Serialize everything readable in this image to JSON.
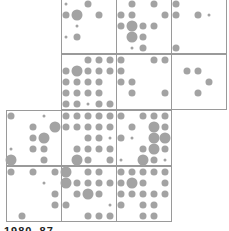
{
  "chart_data": {
    "type": "heatmap",
    "title": "",
    "layout": {
      "cell_size_px": 55,
      "col_x": [
        6,
        61,
        116,
        171
      ],
      "row_y": [
        -2,
        54,
        110,
        166
      ],
      "dot_pitch_px": 11
    },
    "size_scale": {
      "1": 3,
      "2": 7,
      "3": 11
    },
    "cells": [
      {
        "row": 0,
        "col": 1,
        "dots": [
          [
            1,
            0,
            2,
            0,
            0
          ],
          [
            2,
            3,
            0,
            2,
            0
          ],
          [
            0,
            1,
            0,
            0,
            0
          ],
          [
            1,
            2,
            0,
            0,
            0
          ],
          [
            0,
            0,
            0,
            0,
            0
          ]
        ]
      },
      {
        "row": 0,
        "col": 2,
        "dots": [
          [
            0,
            2,
            0,
            2,
            0
          ],
          [
            2,
            2,
            0,
            0,
            2
          ],
          [
            2,
            3,
            2,
            2,
            0
          ],
          [
            0,
            3,
            2,
            0,
            0
          ],
          [
            0,
            1,
            2,
            0,
            0
          ]
        ]
      },
      {
        "row": 0,
        "col": 3,
        "dots": [
          [
            2,
            0,
            0,
            0,
            0
          ],
          [
            2,
            0,
            2,
            1,
            0
          ],
          [
            0,
            0,
            0,
            0,
            0
          ],
          [
            0,
            0,
            0,
            0,
            0
          ],
          [
            2,
            0,
            0,
            0,
            0
          ]
        ]
      },
      {
        "row": 1,
        "col": 1,
        "dots": [
          [
            0,
            0,
            2,
            2,
            2
          ],
          [
            2,
            3,
            2,
            2,
            2
          ],
          [
            2,
            2,
            2,
            2,
            0
          ],
          [
            2,
            2,
            2,
            2,
            0
          ],
          [
            2,
            2,
            1,
            2,
            2
          ]
        ]
      },
      {
        "row": 1,
        "col": 2,
        "dots": [
          [
            2,
            0,
            0,
            2,
            2
          ],
          [
            2,
            0,
            0,
            0,
            0
          ],
          [
            2,
            2,
            0,
            0,
            0
          ],
          [
            0,
            2,
            0,
            0,
            2
          ],
          [
            0,
            0,
            0,
            0,
            0
          ]
        ]
      },
      {
        "row": 1,
        "col": 3,
        "dots": [
          [
            0,
            0,
            0,
            0,
            0
          ],
          [
            0,
            2,
            2,
            0,
            0
          ],
          [
            0,
            0,
            0,
            2,
            0
          ],
          [
            0,
            0,
            2,
            0,
            0
          ],
          [
            0,
            0,
            0,
            0,
            0
          ]
        ]
      },
      {
        "row": 2,
        "col": 0,
        "dots": [
          [
            2,
            0,
            0,
            1,
            0
          ],
          [
            0,
            0,
            2,
            0,
            3
          ],
          [
            0,
            0,
            2,
            3,
            0
          ],
          [
            1,
            0,
            2,
            2,
            0
          ],
          [
            3,
            0,
            0,
            2,
            0
          ]
        ]
      },
      {
        "row": 2,
        "col": 1,
        "dots": [
          [
            2,
            2,
            2,
            2,
            2
          ],
          [
            2,
            2,
            2,
            2,
            2
          ],
          [
            0,
            0,
            2,
            2,
            1
          ],
          [
            0,
            2,
            2,
            2,
            2
          ],
          [
            0,
            3,
            2,
            0,
            2
          ]
        ]
      },
      {
        "row": 2,
        "col": 2,
        "dots": [
          [
            2,
            0,
            2,
            2,
            2
          ],
          [
            0,
            2,
            0,
            3,
            2
          ],
          [
            2,
            1,
            0,
            3,
            3
          ],
          [
            0,
            0,
            2,
            3,
            2
          ],
          [
            1,
            0,
            3,
            2,
            1
          ]
        ]
      },
      {
        "row": 3,
        "col": 0,
        "dots": [
          [
            2,
            0,
            2,
            0,
            2
          ],
          [
            0,
            0,
            0,
            1,
            0
          ],
          [
            0,
            0,
            0,
            0,
            2
          ],
          [
            0,
            0,
            0,
            0,
            2
          ],
          [
            0,
            2,
            0,
            0,
            0
          ]
        ]
      },
      {
        "row": 3,
        "col": 1,
        "dots": [
          [
            3,
            0,
            2,
            2,
            0
          ],
          [
            3,
            2,
            2,
            2,
            2
          ],
          [
            0,
            2,
            3,
            2,
            0
          ],
          [
            2,
            0,
            0,
            0,
            1
          ],
          [
            0,
            0,
            2,
            2,
            2
          ]
        ]
      },
      {
        "row": 3,
        "col": 2,
        "dots": [
          [
            2,
            2,
            2,
            2,
            2
          ],
          [
            2,
            3,
            2,
            0,
            2
          ],
          [
            2,
            2,
            2,
            2,
            2
          ],
          [
            2,
            0,
            2,
            2,
            0
          ],
          [
            0,
            0,
            2,
            2,
            0
          ]
        ]
      }
    ],
    "footer_label": "1980–87"
  },
  "footer": {
    "label": "1980–87"
  }
}
